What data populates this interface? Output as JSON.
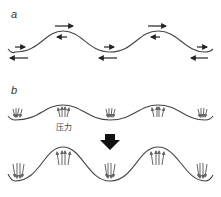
{
  "panels": [
    {
      "label": "a",
      "description": "Wave with opposing shear flow arrows at crests and troughs"
    },
    {
      "label": "b",
      "description": "Wave amplitude growth under pressure",
      "pressure_label": "压力"
    }
  ],
  "colors": {
    "line": "#444444",
    "arrow": "#222222",
    "pressure_arrow": "#666666",
    "big_arrow": "#111111"
  }
}
